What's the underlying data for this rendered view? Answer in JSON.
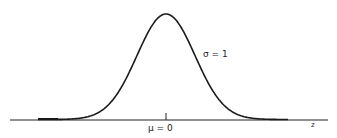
{
  "chart_data": {
    "type": "line",
    "title": "",
    "xlabel": "z",
    "ylabel": "",
    "distribution": "normal",
    "mean": 0,
    "std": 1,
    "annotations": [
      {
        "text": "σ = 1",
        "position": "right of curve, mid-height"
      },
      {
        "text": "μ = 0",
        "position": "below axis at center tick"
      }
    ],
    "x": [
      -4,
      -3.5,
      -3,
      -2.5,
      -2,
      -1.5,
      -1,
      -0.5,
      0,
      0.5,
      1,
      1.5,
      2,
      2.5,
      3,
      3.5,
      4
    ],
    "values": [
      0.0001,
      0.0009,
      0.0044,
      0.0175,
      0.054,
      0.1295,
      0.242,
      0.3521,
      0.3989,
      0.3521,
      0.242,
      0.1295,
      0.054,
      0.0175,
      0.0044,
      0.0009,
      0.0001
    ],
    "xlim": [
      -4.5,
      5.5
    ],
    "grid": false,
    "legend": "none"
  },
  "labels": {
    "sigma": "σ = 1",
    "mu": "μ = 0",
    "axis": "z"
  },
  "colors": {
    "curve": "#1a1a1a",
    "axis": "#222222"
  }
}
